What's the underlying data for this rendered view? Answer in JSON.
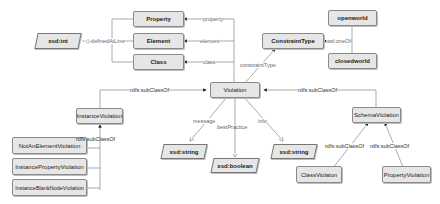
{
  "nodes": {
    "property": "Property",
    "element": "Element",
    "class": "Class",
    "xsd_int": "xsd:int",
    "constraint_type": "ConstraintType",
    "openworld": "openworld",
    "closedworld": "closedworld",
    "violation": "Violation",
    "instance_violation": "InstanceViolation",
    "not_an_element_violation": "NotAnElementViolation",
    "instance_property_violation": "InstancePropertyViolation",
    "instance_blank_node_violation": "InstanceBlankNodeViolation",
    "schema_violation": "SchemaViolation",
    "class_violation": "ClassViolaion",
    "property_violation": "PropertyViolation",
    "xsd_string_message": "xsd:string",
    "xsd_boolean": "xsd:boolean",
    "xsd_string_info": "xsd:string"
  },
  "edges": {
    "property": "property",
    "element": "element",
    "class": "class",
    "defined_at_line": "definedAtLine",
    "owl_one_of": "owl:oneOf",
    "constraint_type": "constraintType",
    "subclass_instance": "rdfs:subClassOf",
    "subclass_schema": "rdfs:subClassOf",
    "subclass_instance_children": "rdfs:subClassOf",
    "subclass_class_violation": "rdfs:subClassOf",
    "subclass_property_violation": "rdfs:subClassOf",
    "message": "message",
    "best_practice": "bestPractice",
    "info": "info"
  }
}
